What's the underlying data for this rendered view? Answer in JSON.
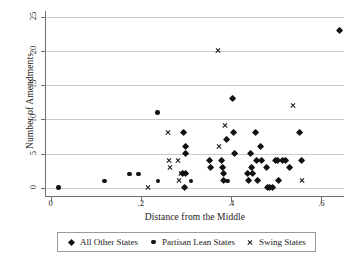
{
  "chart_data": {
    "type": "scatter",
    "title": "",
    "xlabel": "Distance from the Middle",
    "ylabel": "Number of Amendments",
    "xlim": [
      -0.01,
      0.65
    ],
    "ylim": [
      -1.2,
      25.8
    ],
    "xticks": [
      "0",
      ".2",
      ".4",
      ".6"
    ],
    "xtick_values": [
      0,
      0.2,
      0.4,
      0.6
    ],
    "yticks": [
      "0",
      "5",
      "10",
      "15",
      "20",
      "25"
    ],
    "ytick_values": [
      0,
      5,
      10,
      15,
      20,
      25
    ],
    "grid": "horizontal",
    "legend_position": "below-axis",
    "series": [
      {
        "name": "All Other States",
        "marker": "diamond",
        "color": "#111111",
        "points": [
          [
            0.295,
            8
          ],
          [
            0.3,
            6
          ],
          [
            0.3,
            5
          ],
          [
            0.3,
            2
          ],
          [
            0.292,
            2
          ],
          [
            0.297,
            0
          ],
          [
            0.352,
            4
          ],
          [
            0.355,
            3
          ],
          [
            0.38,
            4
          ],
          [
            0.381,
            3
          ],
          [
            0.383,
            2
          ],
          [
            0.384,
            1
          ],
          [
            0.389,
            7
          ],
          [
            0.404,
            13
          ],
          [
            0.406,
            8
          ],
          [
            0.407,
            5
          ],
          [
            0.437,
            2
          ],
          [
            0.439,
            1
          ],
          [
            0.443,
            5
          ],
          [
            0.446,
            3
          ],
          [
            0.447,
            2
          ],
          [
            0.455,
            8
          ],
          [
            0.457,
            4
          ],
          [
            0.459,
            1
          ],
          [
            0.466,
            6
          ],
          [
            0.468,
            4
          ],
          [
            0.478,
            3
          ],
          [
            0.48,
            0
          ],
          [
            0.486,
            0
          ],
          [
            0.492,
            0
          ],
          [
            0.498,
            4
          ],
          [
            0.503,
            4
          ],
          [
            0.505,
            1
          ],
          [
            0.513,
            4
          ],
          [
            0.521,
            4
          ],
          [
            0.53,
            3
          ],
          [
            0.552,
            8
          ],
          [
            0.556,
            4
          ],
          [
            0.64,
            23
          ]
        ]
      },
      {
        "name": "Partisan Lean States",
        "marker": "circle",
        "color": "#111111",
        "points": [
          [
            0.018,
            0
          ],
          [
            0.12,
            1
          ],
          [
            0.175,
            2
          ],
          [
            0.195,
            2
          ],
          [
            0.237,
            11
          ],
          [
            0.238,
            1
          ],
          [
            0.311,
            1
          ],
          [
            0.392,
            1
          ]
        ]
      },
      {
        "name": "Swing States",
        "marker": "cross",
        "color": "#111111",
        "points": [
          [
            0.216,
            0
          ],
          [
            0.261,
            8
          ],
          [
            0.262,
            4
          ],
          [
            0.265,
            3
          ],
          [
            0.283,
            4
          ],
          [
            0.284,
            1
          ],
          [
            0.288,
            2
          ],
          [
            0.372,
            20
          ],
          [
            0.374,
            6
          ],
          [
            0.386,
            9
          ],
          [
            0.538,
            12
          ],
          [
            0.556,
            1
          ]
        ]
      }
    ]
  },
  "legend": {
    "entries": [
      {
        "label": "All Other States",
        "marker": "diamond-marker-icon"
      },
      {
        "label": "Partisan Lean States",
        "marker": "circle-marker-icon"
      },
      {
        "label": "Swing States",
        "marker": "cross-marker-icon"
      }
    ]
  }
}
